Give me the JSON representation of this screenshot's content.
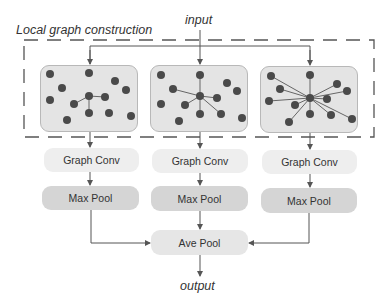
{
  "title": "Local graph construction",
  "input_label": "input",
  "output_label": "output",
  "branches": [
    {
      "graph": {
        "center": [
          89,
          96
        ],
        "nodes": [
          [
            50,
            74
          ],
          [
            89,
            73
          ],
          [
            115,
            81
          ],
          [
            126,
            90
          ],
          [
            62,
            88
          ],
          [
            50,
            100
          ],
          [
            89,
            96
          ],
          [
            105,
            97
          ],
          [
            74,
            104
          ],
          [
            89,
            113
          ],
          [
            109,
            113
          ],
          [
            131,
            116
          ],
          [
            67,
            120
          ]
        ],
        "edges": [
          [
            89,
            96,
            105,
            97
          ],
          [
            89,
            96,
            74,
            104
          ],
          [
            89,
            96,
            89,
            113
          ]
        ]
      },
      "graph_conv_label": "Graph Conv",
      "max_pool_label": "Max Pool"
    },
    {
      "graph": {
        "center": [
          200,
          96
        ],
        "nodes": [
          [
            161,
            75
          ],
          [
            200,
            75
          ],
          [
            227,
            83
          ],
          [
            237,
            91
          ],
          [
            173,
            89
          ],
          [
            200,
            96
          ],
          [
            217,
            98
          ],
          [
            161,
            104
          ],
          [
            185,
            105
          ],
          [
            200,
            114
          ],
          [
            221,
            114
          ],
          [
            242,
            118
          ],
          [
            179,
            121
          ]
        ],
        "edges": [
          [
            200,
            96,
            200,
            75
          ],
          [
            200,
            96,
            173,
            89
          ],
          [
            200,
            96,
            217,
            98
          ],
          [
            200,
            96,
            185,
            105
          ],
          [
            200,
            96,
            200,
            114
          ],
          [
            200,
            96,
            221,
            114
          ]
        ]
      },
      "graph_conv_label": "Graph Conv",
      "max_pool_label": "Max Pool"
    },
    {
      "graph": {
        "center": [
          310,
          98
        ],
        "nodes": [
          [
            271,
            76
          ],
          [
            310,
            75
          ],
          [
            337,
            84
          ],
          [
            347,
            91
          ],
          [
            280,
            89
          ],
          [
            310,
            98
          ],
          [
            327,
            99
          ],
          [
            269,
            101
          ],
          [
            295,
            105
          ],
          [
            310,
            114
          ],
          [
            331,
            115
          ],
          [
            352,
            119
          ],
          [
            289,
            122
          ]
        ],
        "edges": [
          [
            310,
            98,
            271,
            76
          ],
          [
            310,
            98,
            310,
            75
          ],
          [
            310,
            98,
            337,
            84
          ],
          [
            310,
            98,
            347,
            91
          ],
          [
            310,
            98,
            280,
            89
          ],
          [
            310,
            98,
            327,
            99
          ],
          [
            310,
            98,
            269,
            101
          ],
          [
            310,
            98,
            295,
            105
          ],
          [
            310,
            98,
            310,
            114
          ],
          [
            310,
            98,
            331,
            115
          ],
          [
            310,
            98,
            352,
            119
          ],
          [
            310,
            98,
            289,
            122
          ]
        ]
      },
      "graph_conv_label": "Graph Conv",
      "max_pool_label": "Max Pool"
    }
  ],
  "ave_pool_label": "Ave Pool",
  "colors": {
    "node": "#4a4a4a",
    "edge": "#666666",
    "arrow": "#555555",
    "dash": "#555555"
  }
}
